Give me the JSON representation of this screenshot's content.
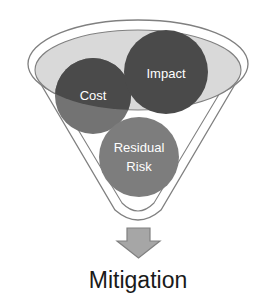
{
  "diagram": {
    "type": "funnel",
    "title_visible": false,
    "funnel": {
      "name": "risk-funnel",
      "rim_fill": "#d9d9d9",
      "rim_band_fill": "#ffffff",
      "body_fill": "#ffffff",
      "outline_color": "#808080"
    },
    "inputs": [
      {
        "id": "cost",
        "label": "Cost",
        "fill": "#4a4a4a",
        "fill_submerged": "#737373",
        "text_color": "#ffffff",
        "cx": 93,
        "cy": 96,
        "r": 38
      },
      {
        "id": "impact",
        "label": "Impact",
        "fill": "#4a4a4a",
        "text_color": "#ffffff",
        "cx": 166,
        "cy": 72,
        "r": 42
      },
      {
        "id": "residual-risk",
        "label": "Residual Risk",
        "label_lines": [
          "Residual",
          "Risk"
        ],
        "fill": "#7d7d7d",
        "text_color": "#ffffff",
        "cx": 139,
        "cy": 157,
        "r": 40
      }
    ],
    "arrow": {
      "name": "down-arrow",
      "fill": "#a6a6a6",
      "stroke": "#808080"
    },
    "output": {
      "label": "Mitigation",
      "color": "#1a1a1a"
    }
  }
}
